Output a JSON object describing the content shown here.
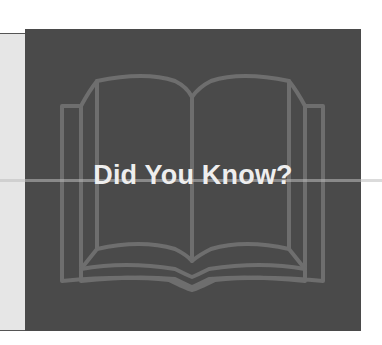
{
  "graphic": {
    "headline": "Did You Know?",
    "icon": "open-book-icon",
    "colors": {
      "background": "#4a4a4a",
      "book_outline": "#6e6e6e",
      "text": "#eeeeee",
      "side_panel": "#e6e6e6"
    }
  }
}
